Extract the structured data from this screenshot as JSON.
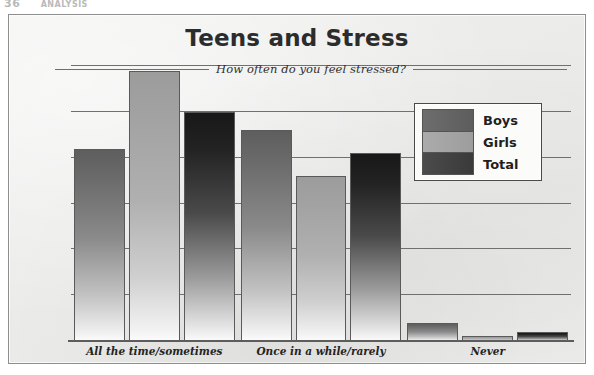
{
  "page_header": {
    "page_number": "36",
    "running_title": "ANALYSIS"
  },
  "chart_data": {
    "type": "bar",
    "title": "Teens and Stress",
    "subtitle": "How often do you feel stressed?",
    "xlabel": "",
    "ylabel": "",
    "ylim": [
      0,
      60
    ],
    "grid": true,
    "grid_axis": "y",
    "legend_position": "upper-right",
    "yticks": [
      0,
      10,
      20,
      30,
      40,
      50,
      60
    ],
    "ytick_labels": [
      "0%",
      "10%",
      "20%",
      "30%",
      "40%",
      "50%",
      "60%"
    ],
    "value_suffix": "%",
    "categories": [
      "All the time/sometimes",
      "Once in a while/rarely",
      "Never"
    ],
    "series": [
      {
        "name": "Boys",
        "color": "#5e5e5e",
        "values": [
          42,
          46,
          4
        ]
      },
      {
        "name": "Girls",
        "color": "#9c9c9c",
        "values": [
          59,
          36,
          1
        ]
      },
      {
        "name": "Total",
        "color": "#1f1f1f",
        "values": [
          50,
          41,
          2
        ]
      }
    ]
  },
  "legend": {
    "items": [
      {
        "label": "Boys"
      },
      {
        "label": "Girls"
      },
      {
        "label": "Total"
      }
    ]
  },
  "colors": {
    "frame_border": "#8e8e8e",
    "paper": "#ececeb",
    "gridline": "#707070",
    "axis": "#5d5d5d",
    "text": "#2c2c2c"
  }
}
